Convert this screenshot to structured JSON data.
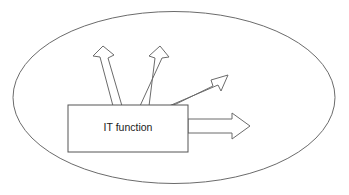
{
  "diagram": {
    "boundary": {
      "name": "enclosing-ellipse",
      "shape": "ellipse",
      "cx": 174,
      "cy": 97.5,
      "rx": 161,
      "ry": 86,
      "stroke_color": "#6b6b6b",
      "fill_color": "#ffffff"
    },
    "node": {
      "label": "IT function",
      "shape": "rectangle",
      "x": 68,
      "y": 105,
      "width": 120,
      "height": 47,
      "stroke_color": "#555555",
      "fill_color": "#ffffff",
      "text_color": "#1a1a1a"
    },
    "arrows": [
      {
        "name": "arrow-up-left",
        "label": "",
        "direction": "up-left",
        "from": [
          118,
          105
        ],
        "to": [
          103,
          46
        ],
        "style": "hollow-outline",
        "stroke_color": "#6b6b6b",
        "fill_color": "#ffffff"
      },
      {
        "name": "arrow-up-right",
        "label": "",
        "direction": "up-right",
        "from": [
          145,
          105
        ],
        "to": [
          160,
          46
        ],
        "style": "hollow-outline",
        "stroke_color": "#6b6b6b",
        "fill_color": "#ffffff"
      },
      {
        "name": "arrow-diagonal-up-right",
        "label": "",
        "direction": "diagonal-up-right",
        "from": [
          176,
          105
        ],
        "to": [
          228,
          75
        ],
        "style": "hollow-outline",
        "stroke_color": "#6b6b6b",
        "fill_color": "#ffffff"
      },
      {
        "name": "arrow-right",
        "label": "",
        "direction": "right",
        "from": [
          188,
          126
        ],
        "to": [
          250,
          126
        ],
        "style": "hollow-outline",
        "stroke_color": "#6b6b6b",
        "fill_color": "#ffffff"
      }
    ]
  }
}
